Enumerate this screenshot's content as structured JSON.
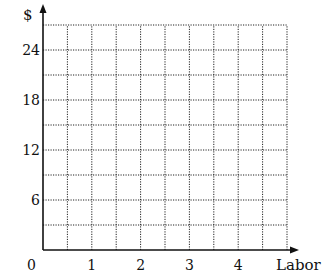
{
  "chart_data": {
    "type": "line",
    "title": "",
    "xlabel": "Labor",
    "ylabel": "$",
    "xlim": [
      0,
      5
    ],
    "ylim": [
      0,
      27
    ],
    "x_ticks": [
      0,
      1,
      2,
      3,
      4
    ],
    "x_tick_labels": [
      "0",
      "1",
      "2",
      "3",
      "4"
    ],
    "y_ticks": [
      6,
      12,
      18,
      24
    ],
    "y_tick_labels": [
      "6",
      "12",
      "18",
      "24"
    ],
    "x_grid_step": 0.5,
    "y_grid_step": 3,
    "grid": true,
    "grid_style": "dotted",
    "series": [],
    "origin_label": "0"
  }
}
